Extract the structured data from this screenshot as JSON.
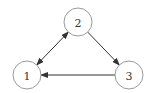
{
  "diagram": {
    "type": "directed-graph",
    "nodes": [
      {
        "id": "1",
        "label": "1"
      },
      {
        "id": "2",
        "label": "2"
      },
      {
        "id": "3",
        "label": "3"
      }
    ],
    "edges": [
      {
        "from": "1",
        "to": "2",
        "direction": "both"
      },
      {
        "from": "2",
        "to": "3",
        "direction": "forward"
      },
      {
        "from": "3",
        "to": "1",
        "direction": "forward"
      }
    ],
    "colors": {
      "node_stroke": "#9a9a9a",
      "edge_stroke": "#333333",
      "label": "#333333",
      "background": "#ffffff"
    }
  }
}
